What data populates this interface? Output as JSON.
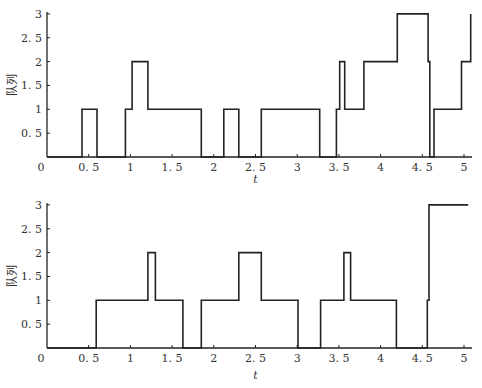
{
  "chart_data": [
    {
      "type": "line",
      "subtype": "step",
      "title": "",
      "xlabel": "t",
      "ylabel": "队列",
      "xlim": [
        0,
        5.1
      ],
      "ylim": [
        0,
        3
      ],
      "xticks": [
        "0",
        "0.5",
        "1",
        "1.5",
        "2",
        "2.5",
        "3",
        "3.5",
        "4",
        "4.5",
        "5"
      ],
      "yticks": [
        "0.5",
        "1",
        "1.5",
        "2",
        "2.5",
        "3"
      ],
      "grid": false,
      "legend": null,
      "series": [
        {
          "name": "queue-top",
          "x": [
            0,
            0.42,
            0.42,
            0.6,
            0.6,
            0.94,
            0.94,
            1.02,
            1.02,
            1.21,
            1.21,
            1.85,
            1.85,
            2.12,
            2.12,
            2.3,
            2.3,
            2.57,
            2.57,
            3.27,
            3.27,
            3.47,
            3.47,
            3.51,
            3.51,
            3.57,
            3.57,
            3.8,
            3.8,
            4.2,
            4.2,
            4.57,
            4.57,
            4.59,
            4.59,
            4.64,
            4.64,
            4.97,
            4.97,
            5.08,
            5.08
          ],
          "y": [
            0,
            0,
            1,
            1,
            0,
            0,
            1,
            1,
            2,
            2,
            1,
            1,
            0,
            0,
            1,
            1,
            0,
            0,
            1,
            1,
            0,
            0,
            1,
            1,
            2,
            2,
            1,
            1,
            2,
            2,
            3,
            3,
            2,
            2,
            0,
            0,
            1,
            1,
            2,
            2,
            3
          ]
        }
      ]
    },
    {
      "type": "line",
      "subtype": "step",
      "title": "",
      "xlabel": "t",
      "ylabel": "队列",
      "xlim": [
        0,
        5.1
      ],
      "ylim": [
        0,
        3
      ],
      "xticks": [
        "0",
        "0.5",
        "1",
        "1.5",
        "2",
        "2.5",
        "3",
        "3.5",
        "4",
        "4.5",
        "5"
      ],
      "yticks": [
        "0.5",
        "1",
        "1.5",
        "2",
        "2.5",
        "3"
      ],
      "grid": false,
      "legend": null,
      "series": [
        {
          "name": "queue-bottom",
          "x": [
            0,
            0.59,
            0.59,
            1.21,
            1.21,
            1.3,
            1.3,
            1.63,
            1.63,
            1.85,
            1.85,
            2.3,
            2.3,
            2.57,
            2.57,
            3.01,
            3.01,
            3.28,
            3.28,
            3.56,
            3.56,
            3.64,
            3.64,
            4.19,
            4.19,
            4.56,
            4.56,
            4.58,
            4.58,
            5.05
          ],
          "y": [
            0,
            0,
            1,
            1,
            2,
            2,
            1,
            1,
            0,
            0,
            1,
            1,
            2,
            2,
            1,
            1,
            0,
            0,
            1,
            1,
            2,
            2,
            1,
            1,
            0,
            0,
            1,
            1,
            3,
            3
          ]
        }
      ]
    }
  ],
  "panels": [
    {
      "ylabel": "队列",
      "xlabel": "t",
      "origin_label": "0",
      "xtick_labels": [
        "0.5",
        "1",
        "1.5",
        "2",
        "2.5",
        "3",
        "3.5",
        "4",
        "4.5",
        "5"
      ],
      "ytick_labels": [
        "0.5",
        "1",
        "1.5",
        "2",
        "2.5",
        "3"
      ]
    },
    {
      "ylabel": "队列",
      "xlabel": "t",
      "origin_label": "0",
      "xtick_labels": [
        "0.5",
        "1",
        "1.5",
        "2",
        "2.5",
        "3",
        "3.5",
        "4",
        "4.5",
        "5"
      ],
      "ytick_labels": [
        "0.5",
        "1",
        "1.5",
        "2",
        "2.5",
        "3"
      ]
    }
  ],
  "style": {
    "line_color": "#222222",
    "axis_color": "#222222",
    "text_color": "#333333",
    "background": "#ffffff"
  }
}
